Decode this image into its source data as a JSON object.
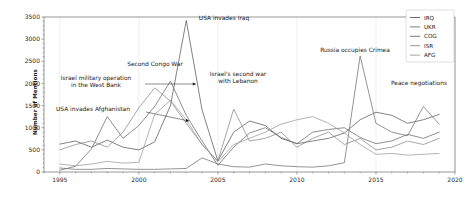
{
  "figure": {
    "background_color": "#ffffff",
    "width": 470,
    "height": 203
  },
  "chart_data": {
    "type": "line",
    "title": "",
    "xlabel": "",
    "ylabel": "Number of Mentions",
    "xlim": [
      1994,
      2020
    ],
    "ylim": [
      0,
      3500
    ],
    "yticks": [
      0,
      500,
      1000,
      1500,
      2000,
      2500,
      3000,
      3500
    ],
    "xticks": [
      1995,
      2000,
      2005,
      2010,
      2015,
      2020
    ],
    "grid": "vertical",
    "legend_position": "upper right",
    "x": [
      1995,
      1996,
      1997,
      1998,
      1999,
      2000,
      2001,
      2002,
      2003,
      2004,
      2005,
      2006,
      2007,
      2008,
      2009,
      2010,
      2011,
      2012,
      2013,
      2014,
      2015,
      2016,
      2017,
      2018,
      2019
    ],
    "series": [
      {
        "name": "IRQ",
        "color": "#5a5a5a",
        "values": [
          630,
          700,
          560,
          720,
          560,
          500,
          680,
          1500,
          3420,
          1400,
          250,
          900,
          1150,
          1050,
          760,
          640,
          700,
          760,
          880,
          1180,
          1350,
          1280,
          1100,
          1180,
          1300
        ]
      },
      {
        "name": "UKR",
        "color": "#707070",
        "values": [
          90,
          60,
          60,
          80,
          70,
          60,
          60,
          70,
          80,
          320,
          180,
          120,
          110,
          180,
          140,
          120,
          110,
          140,
          210,
          2620,
          1100,
          900,
          820,
          1480,
          1080
        ]
      },
      {
        "name": "COG",
        "color": "#6a6a6a",
        "values": [
          40,
          130,
          520,
          1250,
          760,
          1050,
          1480,
          2050,
          1280,
          700,
          150,
          560,
          880,
          1000,
          780,
          640,
          900,
          960,
          1000,
          780,
          640,
          700,
          850,
          760,
          900
        ]
      },
      {
        "name": "ISR",
        "color": "#888888",
        "values": [
          500,
          620,
          700,
          560,
          900,
          1450,
          1900,
          1600,
          1100,
          620,
          250,
          1420,
          700,
          760,
          900,
          560,
          760,
          900,
          620,
          760,
          500,
          560,
          700,
          620,
          760
        ]
      },
      {
        "name": "AFG",
        "color": "#9a9a9a",
        "values": [
          180,
          140,
          180,
          240,
          200,
          220,
          1300,
          1620,
          1180,
          620,
          230,
          620,
          760,
          900,
          1080,
          1180,
          1250,
          1100,
          880,
          620,
          400,
          420,
          380,
          400,
          420
        ]
      }
    ],
    "annotations": [
      {
        "text_lines": [
          "Israel military operation",
          "in the West Bank"
        ],
        "text_x": 96,
        "text_y": 80,
        "arrow_from_x": 145,
        "arrow_from_y": 84,
        "arrow_to_x": 196,
        "arrow_to_y": 84
      },
      {
        "text_lines": [
          "USA invades Afghanistan"
        ],
        "text_x": 93,
        "text_y": 111,
        "arrow_from_x": 146,
        "arrow_from_y": 112,
        "arrow_to_x": 189,
        "arrow_to_y": 121
      },
      {
        "text_lines": [
          "Second Congo War"
        ],
        "text_x": 155,
        "text_y": 66,
        "arrow_from_x": null,
        "arrow_from_y": null,
        "arrow_to_x": null,
        "arrow_to_y": null
      },
      {
        "text_lines": [
          "USA invades Iraq"
        ],
        "text_x": 224,
        "text_y": 20,
        "arrow_from_x": null,
        "arrow_from_y": null,
        "arrow_to_x": null,
        "arrow_to_y": null
      },
      {
        "text_lines": [
          "Israel's second war",
          "with Lebanon"
        ],
        "text_x": 238,
        "text_y": 76,
        "arrow_from_x": null,
        "arrow_from_y": null,
        "arrow_to_x": null,
        "arrow_to_y": null
      },
      {
        "text_lines": [
          "Russia occupies Crimea"
        ],
        "text_x": 355,
        "text_y": 52,
        "arrow_from_x": null,
        "arrow_from_y": null,
        "arrow_to_x": null,
        "arrow_to_y": null
      },
      {
        "text_lines": [
          "Peace negotiations"
        ],
        "text_x": 419,
        "text_y": 85,
        "arrow_from_x": null,
        "arrow_from_y": null,
        "arrow_to_x": null,
        "arrow_to_y": null
      }
    ]
  }
}
